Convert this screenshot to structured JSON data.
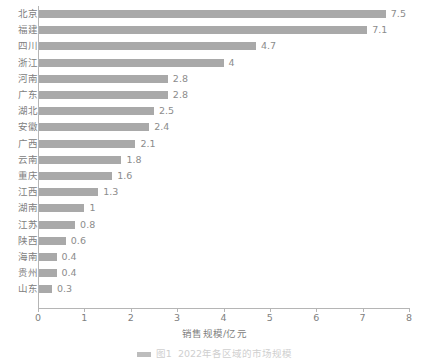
{
  "chart_data": {
    "type": "bar",
    "orientation": "horizontal",
    "title": "",
    "xlabel": "销售规模/亿元",
    "ylabel": "",
    "xlim": [
      0,
      8
    ],
    "xticks": [
      "0",
      "1",
      "2",
      "3",
      "4",
      "5",
      "6",
      "7",
      "8"
    ],
    "grid": false,
    "legend": null,
    "bar_color": "#a9a9a9",
    "axis_color": "#b5b5b5",
    "text_color": "#808080",
    "categories": [
      "北京",
      "福建",
      "四川",
      "浙江",
      "河南",
      "广东",
      "湖北",
      "安徽",
      "广西",
      "云南",
      "重庆",
      "江西",
      "湖南",
      "江苏",
      "陕西",
      "海南",
      "贵州",
      "山东"
    ],
    "values": [
      7.5,
      7.1,
      4.7,
      4,
      2.8,
      2.8,
      2.5,
      2.4,
      2.1,
      1.8,
      1.6,
      1.3,
      1,
      0.8,
      0.6,
      0.4,
      0.4,
      0.3
    ],
    "value_labels": [
      "7.5",
      "7.1",
      "4.7",
      "4",
      "2.8",
      "2.8",
      "2.5",
      "2.4",
      "2.1",
      "1.8",
      "1.6",
      "1.3",
      "1",
      "0.8",
      "0.6",
      "0.4",
      "0.4",
      "0.3"
    ]
  },
  "caption": {
    "marker_label": "图1",
    "text": "2022年各区域的市场规模"
  }
}
